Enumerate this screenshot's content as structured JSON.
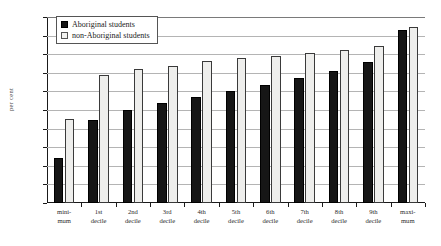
{
  "chart_data": {
    "type": "bar",
    "title": "",
    "xlabel": "",
    "ylabel": "per cent",
    "ylim": [
      0,
      100
    ],
    "ytick_step": 10,
    "yticks": [
      0,
      10,
      20,
      30,
      40,
      50,
      60,
      70,
      80,
      90,
      100
    ],
    "grid": true,
    "legend_position": "top-left inside plot",
    "categories": [
      "mini-mum",
      "1st decile",
      "2nd decile",
      "3rd decile",
      "4th decile",
      "5th decile",
      "6th decile",
      "7th decile",
      "8th decile",
      "9th decile",
      "maxi-mum"
    ],
    "category_lines": [
      [
        "mini-",
        "mum"
      ],
      [
        "1st",
        "decile"
      ],
      [
        "2nd",
        "decile"
      ],
      [
        "3rd",
        "decile"
      ],
      [
        "4th",
        "decile"
      ],
      [
        "5th",
        "decile"
      ],
      [
        "6th",
        "decile"
      ],
      [
        "7th",
        "decile"
      ],
      [
        "8th",
        "decile"
      ],
      [
        "9th",
        "decile"
      ],
      [
        "maxi-",
        "mum"
      ]
    ],
    "series": [
      {
        "name": "Aboriginal students",
        "color": "#161616",
        "values": [
          24,
          44.5,
          50,
          54,
          57,
          60,
          63.5,
          67,
          71,
          76,
          93
        ]
      },
      {
        "name": "non-Aboriginal students",
        "color": "#eeeeec",
        "values": [
          45,
          69,
          72,
          73.5,
          76.5,
          78,
          79,
          80.5,
          82,
          84.5,
          94.5
        ]
      }
    ]
  },
  "legend": {
    "items": [
      {
        "label": "Aboriginal students",
        "swatch": "filled-black-square"
      },
      {
        "label": "non-Aboriginal students",
        "swatch": "outlined-white-square"
      }
    ]
  },
  "colors": {
    "aboriginal_bar": "#161616",
    "non_aboriginal_bar": "#eeeeec",
    "non_aboriginal_border": "#3a3a3a",
    "gridline": "#b4b4b4",
    "axis": "#1a1a1a",
    "background": "#ffffff"
  }
}
